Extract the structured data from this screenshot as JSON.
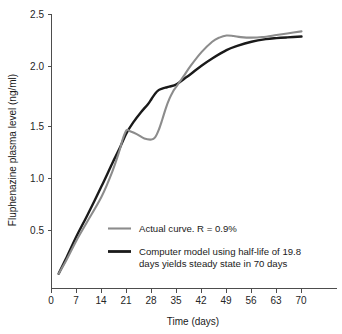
{
  "chart_data": {
    "type": "line",
    "title": "",
    "xlabel": "Time (days)",
    "ylabel": "Fluphenazine plasma level (ng/ml)",
    "xlim": [
      0,
      73
    ],
    "ylim": [
      0,
      2.5
    ],
    "xticks": [
      0,
      7,
      14,
      21,
      28,
      35,
      42,
      49,
      56,
      63,
      70
    ],
    "xtick_labels": [
      "0",
      "7",
      "14",
      "21",
      "28",
      "35",
      "42",
      "49",
      "56",
      "63",
      "70"
    ],
    "yticks": [
      0.5,
      1.0,
      1.5,
      2.0,
      2.5
    ],
    "ytick_labels": [
      "0.5",
      "1.0",
      "1.5",
      "2.0",
      "2.5"
    ],
    "grid": false,
    "legend_position": "lower-center",
    "series": [
      {
        "name": "Actual curve. R = 0.9%",
        "color": "#8c8c8c",
        "x": [
          2,
          4,
          7,
          10,
          14,
          17,
          19,
          20,
          21,
          22,
          24,
          26,
          28,
          29,
          30,
          31,
          32,
          33,
          34,
          35,
          37,
          39,
          42,
          45,
          47,
          49,
          51,
          53,
          56,
          59,
          63,
          66,
          70
        ],
        "y": [
          0.08,
          0.2,
          0.4,
          0.58,
          0.82,
          1.06,
          1.26,
          1.38,
          1.46,
          1.45,
          1.42,
          1.38,
          1.37,
          1.39,
          1.46,
          1.56,
          1.67,
          1.76,
          1.83,
          1.88,
          1.98,
          2.08,
          2.21,
          2.31,
          2.35,
          2.37,
          2.365,
          2.355,
          2.35,
          2.355,
          2.375,
          2.39,
          2.41
        ]
      },
      {
        "name": "Computer model using half-life of 19.8 days yields steady state in 70 days",
        "color": "#1a1a1a",
        "x": [
          2,
          4,
          7,
          10,
          14,
          17,
          19,
          21,
          23,
          25,
          27,
          28,
          29,
          30,
          31,
          32,
          33,
          35,
          37,
          39,
          42,
          45,
          49,
          52,
          56,
          60,
          63,
          66,
          70
        ],
        "y": [
          0.08,
          0.22,
          0.44,
          0.64,
          0.92,
          1.14,
          1.28,
          1.43,
          1.54,
          1.63,
          1.71,
          1.76,
          1.81,
          1.845,
          1.86,
          1.87,
          1.878,
          1.9,
          1.95,
          2.0,
          2.08,
          2.15,
          2.23,
          2.27,
          2.31,
          2.335,
          2.345,
          2.352,
          2.36
        ]
      }
    ],
    "legend_entries": [
      {
        "label": "Actual curve. R = 0.9%",
        "color": "#8c8c8c",
        "lines": [
          "Actual curve. R = 0.9%"
        ]
      },
      {
        "label": "Computer model using half-life of 19.8 days yields steady state in 70 days",
        "color": "#1a1a1a",
        "lines": [
          "Computer model using half-life of 19.8",
          "days yields steady state in 70 days"
        ]
      }
    ]
  },
  "labels": {
    "x_axis_title": "Time (days)",
    "y_axis_title": "Fluphenazine plasma level (ng/ml)",
    "xtick_0": "0",
    "xtick_1": "7",
    "xtick_2": "14",
    "xtick_3": "21",
    "xtick_4": "28",
    "xtick_5": "35",
    "xtick_6": "42",
    "xtick_7": "49",
    "xtick_8": "56",
    "xtick_9": "63",
    "xtick_10": "70",
    "ytick_0": "0.5",
    "ytick_1": "1.0",
    "ytick_2": "1.5",
    "ytick_3": "2.0",
    "ytick_4": "2.5",
    "legend_1_line_1": "Actual curve. R = 0.9%",
    "legend_2_line_1": "Computer model using half-life of 19.8",
    "legend_2_line_2": "days yields steady state in 70 days"
  },
  "colors": {
    "actual_curve": "#8c8c8c",
    "model_curve": "#1a1a1a",
    "axis": "#4d4d4d",
    "background": "#ffffff"
  }
}
